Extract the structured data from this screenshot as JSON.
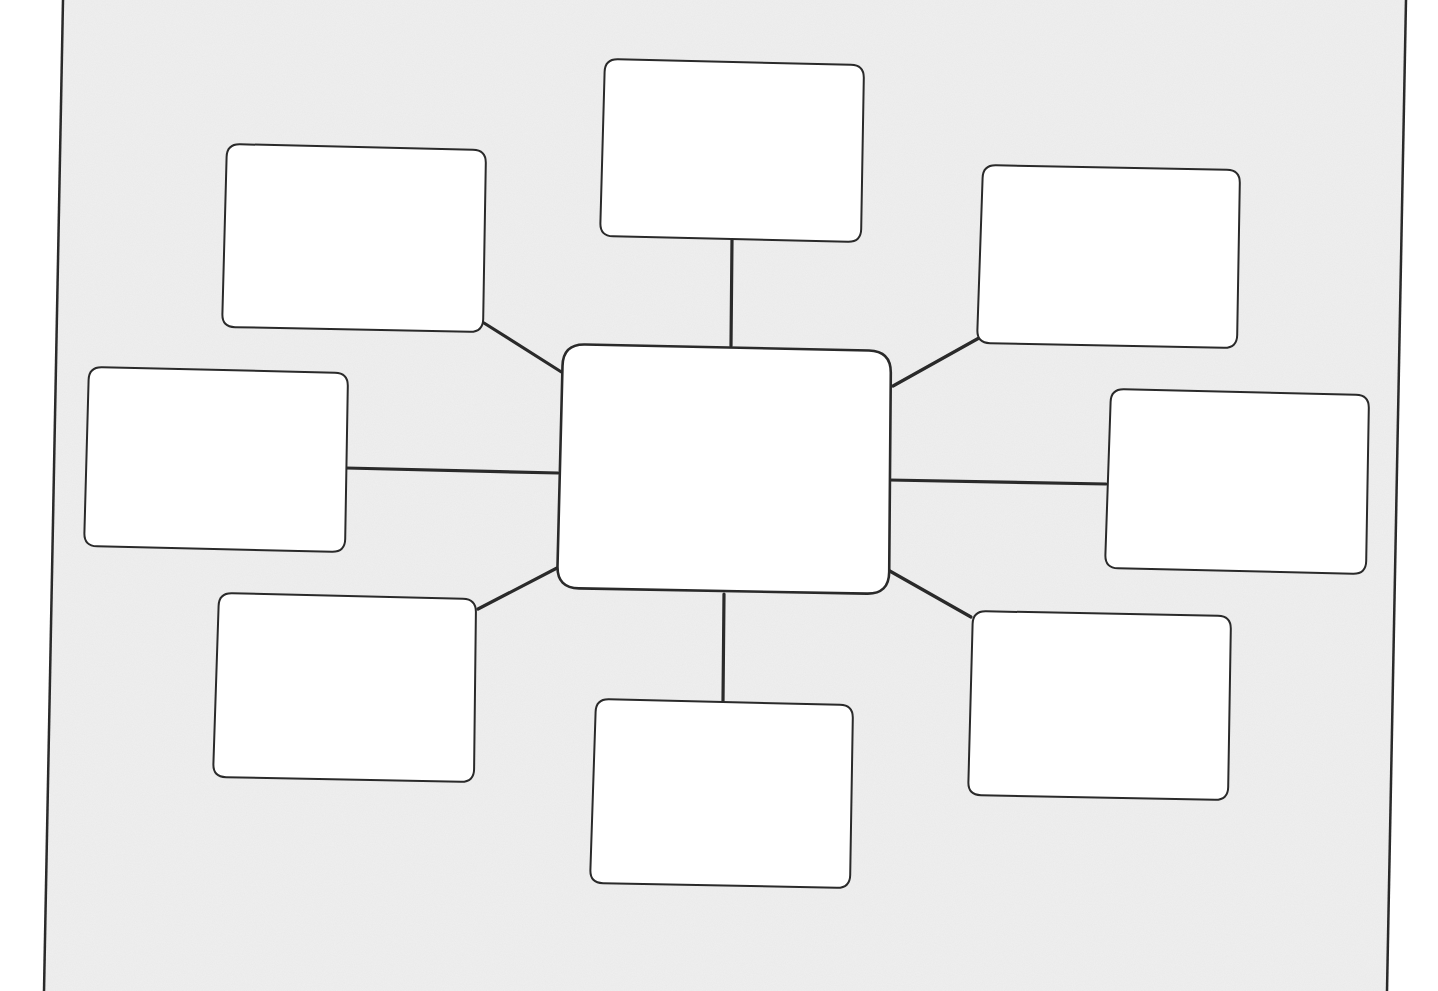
{
  "diagram": {
    "type": "spider-map-worksheet",
    "colors": {
      "page_background": "#efefef",
      "outside_background": "#ffffff",
      "box_fill": "#ffffff",
      "stroke": "#2a2a2a"
    },
    "frame": {
      "left_edge": {
        "x_top": 63,
        "x_bottom": 44
      },
      "right_edge": {
        "x_top": 1406,
        "x_bottom": 1387
      }
    },
    "center_box": {
      "id": "center",
      "label": "",
      "corners": [
        [
          563,
          344
        ],
        [
          891,
          351
        ],
        [
          889,
          594
        ],
        [
          557,
          588
        ]
      ]
    },
    "satellite_boxes": [
      {
        "id": "top",
        "label": "",
        "corners": [
          [
            605,
            59
          ],
          [
            864,
            65
          ],
          [
            861,
            242
          ],
          [
            600,
            236
          ]
        ]
      },
      {
        "id": "upper-left",
        "label": "",
        "corners": [
          [
            227,
            144
          ],
          [
            486,
            150
          ],
          [
            483,
            332
          ],
          [
            222,
            327
          ]
        ]
      },
      {
        "id": "upper-right",
        "label": "",
        "corners": [
          [
            983,
            165
          ],
          [
            1240,
            170
          ],
          [
            1237,
            348
          ],
          [
            977,
            343
          ]
        ]
      },
      {
        "id": "left",
        "label": "",
        "corners": [
          [
            89,
            367
          ],
          [
            348,
            373
          ],
          [
            345,
            552
          ],
          [
            84,
            546
          ]
        ]
      },
      {
        "id": "right",
        "label": "",
        "corners": [
          [
            1111,
            389
          ],
          [
            1369,
            395
          ],
          [
            1366,
            574
          ],
          [
            1105,
            568
          ]
        ]
      },
      {
        "id": "lower-left",
        "label": "",
        "corners": [
          [
            219,
            593
          ],
          [
            476,
            599
          ],
          [
            474,
            782
          ],
          [
            213,
            777
          ]
        ]
      },
      {
        "id": "lower-right",
        "label": "",
        "corners": [
          [
            973,
            611
          ],
          [
            1231,
            616
          ],
          [
            1228,
            800
          ],
          [
            968,
            795
          ]
        ]
      },
      {
        "id": "bottom",
        "label": "",
        "corners": [
          [
            596,
            699
          ],
          [
            853,
            705
          ],
          [
            850,
            888
          ],
          [
            590,
            883
          ]
        ]
      }
    ],
    "connectors": [
      {
        "id": "to-top",
        "from": [
          731,
          346
        ],
        "to": [
          732,
          240
        ]
      },
      {
        "id": "to-upper-left",
        "from": [
          563,
          373
        ],
        "to": [
          484,
          323
        ]
      },
      {
        "id": "to-upper-right",
        "from": [
          893,
          386
        ],
        "to": [
          979,
          338
        ]
      },
      {
        "id": "to-left",
        "from": [
          558,
          473
        ],
        "to": [
          346,
          468
        ]
      },
      {
        "id": "to-right",
        "from": [
          889,
          480
        ],
        "to": [
          1106,
          484
        ]
      },
      {
        "id": "to-lower-left",
        "from": [
          557,
          568
        ],
        "to": [
          478,
          609
        ]
      },
      {
        "id": "to-lower-right",
        "from": [
          888,
          570
        ],
        "to": [
          971,
          617
        ]
      },
      {
        "id": "to-bottom",
        "from": [
          724,
          594
        ],
        "to": [
          723,
          701
        ]
      }
    ]
  }
}
